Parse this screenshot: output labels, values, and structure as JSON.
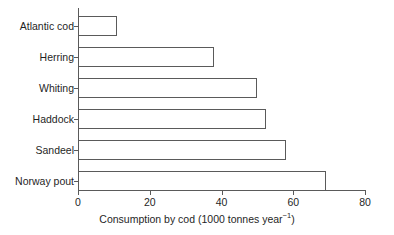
{
  "chart_data": {
    "type": "bar",
    "orientation": "horizontal",
    "title": "",
    "xlabel": "Consumption by cod (1000 tonnes year⁻¹)",
    "ylabel": "",
    "xlim": [
      0,
      80
    ],
    "xticks": [
      0,
      20,
      40,
      60,
      80
    ],
    "grid": false,
    "legend": null,
    "categories": [
      "Atlantic cod",
      "Herring",
      "Whiting",
      "Haddock",
      "Sandeel",
      "Norway pout"
    ],
    "values": [
      11,
      38,
      50,
      52.5,
      58,
      69
    ],
    "bar_fill": "#ffffff",
    "bar_edge": "#5a5a5a"
  },
  "axis": {
    "x_title_main": "Consumption by cod (1000 tonnes year",
    "x_title_sup": "−1",
    "x_title_close": ")",
    "tick_labels": [
      "0",
      "20",
      "40",
      "60",
      "80"
    ]
  },
  "colors": {
    "background": "#ffffff",
    "axis": "#5a5a5a",
    "text": "#1f1f1f"
  }
}
